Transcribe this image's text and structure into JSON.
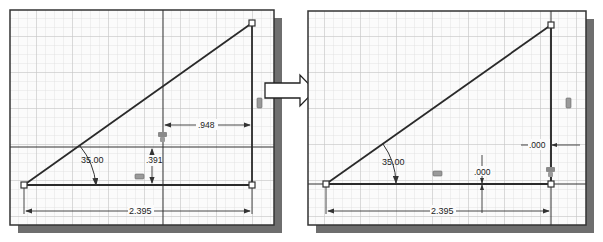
{
  "colors": {
    "background": "#ffffff",
    "panel_bg": "#fbfbfb",
    "grid_minor": "#dcdcdc",
    "grid_major": "#bdbdbd",
    "frame": "#333333",
    "shadow": "#6e6e6e",
    "geometry": "#2a2a2a",
    "dimension": "#333333",
    "constraint_icon": "#8a8a8a"
  },
  "before_panel": {
    "label": "before",
    "angle_dimension": "35.00",
    "horizontal_offset_dimension": ".948",
    "vertical_offset_dimension": ".391",
    "base_length_dimension": "2.395",
    "constraint_icons": [
      "horizontal-constraint-icon",
      "vertical-constraint-icon",
      "coincident-constraint-icon"
    ]
  },
  "arrow": {
    "label": "transition-arrow",
    "direction": "right"
  },
  "after_panel": {
    "label": "after",
    "angle_dimension": "35.00",
    "horizontal_offset_dimension": ".000",
    "vertical_offset_dimension": ".000",
    "base_length_dimension": "2.395",
    "constraint_icons": [
      "horizontal-constraint-icon",
      "vertical-constraint-icon",
      "coincident-constraint-icon"
    ]
  }
}
